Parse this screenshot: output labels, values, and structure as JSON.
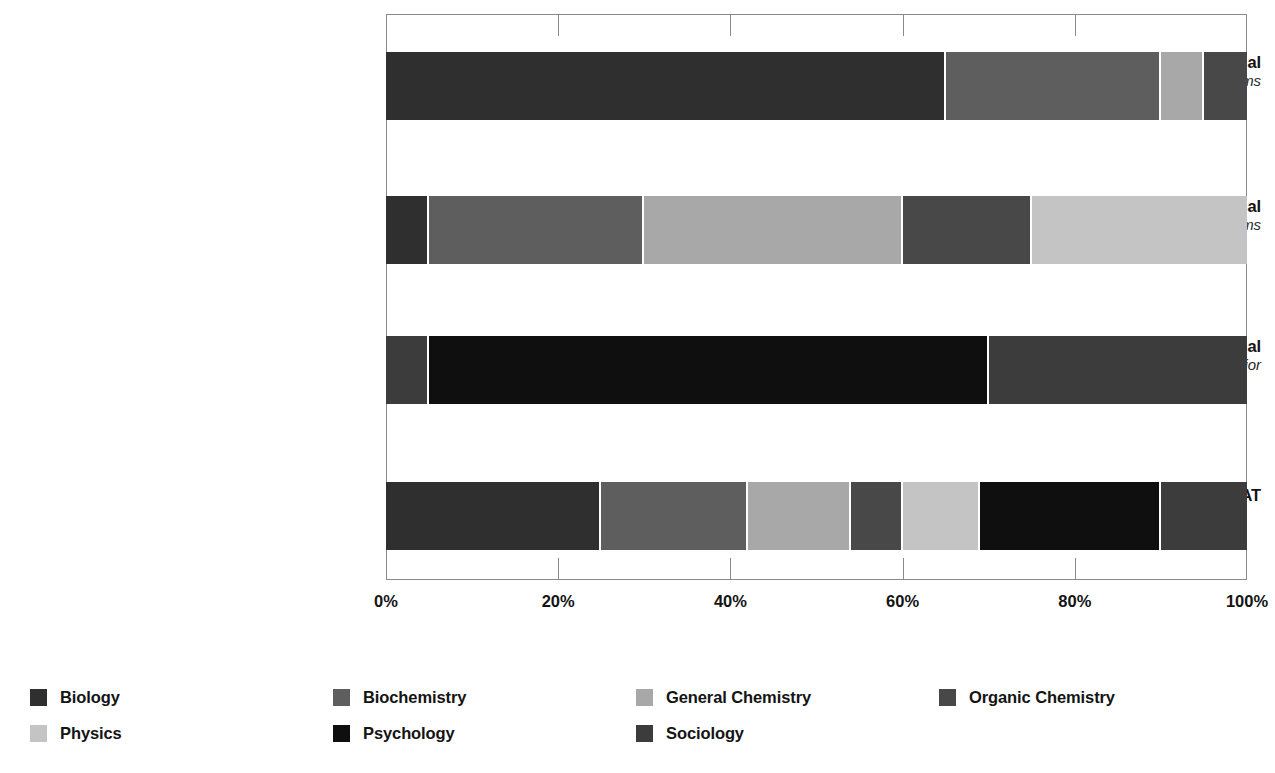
{
  "chart_data": {
    "type": "bar",
    "orientation": "horizontal",
    "stacked": true,
    "normalized_percent": true,
    "title": "",
    "xlabel": "",
    "ylabel": "",
    "xlim": [
      0,
      100
    ],
    "xticks": [
      "0%",
      "20%",
      "40%",
      "60%",
      "80%",
      "100%"
    ],
    "xtick_values": [
      0,
      20,
      40,
      60,
      80,
      100
    ],
    "grid": true,
    "legend_position": "bottom",
    "categories": [
      {
        "main": "Biological and Biochemical",
        "sub": "Foundations of Living Systems"
      },
      {
        "main": "Chemical and Physical",
        "sub": "Foundations of Biological Systems"
      },
      {
        "main": "Psychological, Social, and Biological",
        "sub": "Foundations of Behavior"
      },
      {
        "main": "MCAT",
        "sub": ""
      }
    ],
    "series": [
      {
        "name": "Biology",
        "color": "#2f2f2f",
        "values": [
          65,
          5,
          5,
          25
        ]
      },
      {
        "name": "Biochemistry",
        "color": "#5e5e5e",
        "values": [
          25,
          25,
          0,
          17
        ]
      },
      {
        "name": "General Chemistry",
        "color": "#a8a8a8",
        "values": [
          5,
          30,
          0,
          12
        ]
      },
      {
        "name": "Organic Chemistry",
        "color": "#484848",
        "values": [
          5,
          15,
          0,
          6
        ]
      },
      {
        "name": "Physics",
        "color": "#c4c4c4",
        "values": [
          0,
          25,
          0,
          9
        ]
      },
      {
        "name": "Psychology",
        "color": "#0f0f0f",
        "values": [
          0,
          0,
          65,
          21
        ]
      },
      {
        "name": "Sociology",
        "color": "#3c3c3c",
        "values": [
          0,
          0,
          30,
          10
        ]
      }
    ],
    "bars": [
      {
        "category": "Biological and Biochemical",
        "segments": [
          {
            "name": "Biology",
            "value": 65,
            "color": "#2f2f2f"
          },
          {
            "name": "Biochemistry",
            "value": 25,
            "color": "#5e5e5e"
          },
          {
            "name": "General Chemistry",
            "value": 5,
            "color": "#a8a8a8"
          },
          {
            "name": "Organic Chemistry",
            "value": 5,
            "color": "#484848"
          }
        ]
      },
      {
        "category": "Chemical and Physical",
        "segments": [
          {
            "name": "Biology",
            "value": 5,
            "color": "#2f2f2f"
          },
          {
            "name": "Biochemistry",
            "value": 25,
            "color": "#5e5e5e"
          },
          {
            "name": "General Chemistry",
            "value": 30,
            "color": "#a8a8a8"
          },
          {
            "name": "Organic Chemistry",
            "value": 15,
            "color": "#484848"
          },
          {
            "name": "Physics",
            "value": 25,
            "color": "#c4c4c4"
          }
        ]
      },
      {
        "category": "Psychological, Social, and Biological",
        "segments": [
          {
            "name": "Biology",
            "value": 5,
            "color": "#3c3c3c"
          },
          {
            "name": "Psychology",
            "value": 65,
            "color": "#0f0f0f"
          },
          {
            "name": "Sociology",
            "value": 30,
            "color": "#3c3c3c"
          }
        ]
      },
      {
        "category": "MCAT",
        "segments": [
          {
            "name": "Biology",
            "value": 25,
            "color": "#2f2f2f"
          },
          {
            "name": "Biochemistry",
            "value": 17,
            "color": "#5e5e5e"
          },
          {
            "name": "General Chemistry",
            "value": 12,
            "color": "#a8a8a8"
          },
          {
            "name": "Organic Chemistry",
            "value": 6,
            "color": "#484848"
          },
          {
            "name": "Physics",
            "value": 9,
            "color": "#c4c4c4"
          },
          {
            "name": "Psychology",
            "value": 21,
            "color": "#0f0f0f"
          },
          {
            "name": "Sociology",
            "value": 10,
            "color": "#3c3c3c"
          }
        ]
      }
    ]
  },
  "axis": {
    "ticks": [
      {
        "label": "0%",
        "value": 0
      },
      {
        "label": "20%",
        "value": 20
      },
      {
        "label": "40%",
        "value": 40
      },
      {
        "label": "60%",
        "value": 60
      },
      {
        "label": "80%",
        "value": 80
      },
      {
        "label": "100%",
        "value": 100
      }
    ]
  },
  "legend": {
    "rows": [
      [
        {
          "label": "Biology",
          "color": "#2f2f2f"
        },
        {
          "label": "Biochemistry",
          "color": "#5e5e5e"
        },
        {
          "label": "General Chemistry",
          "color": "#a8a8a8"
        },
        {
          "label": "Organic Chemistry",
          "color": "#484848"
        }
      ],
      [
        {
          "label": "Physics",
          "color": "#c4c4c4"
        },
        {
          "label": "Psychology",
          "color": "#0f0f0f"
        },
        {
          "label": "Sociology",
          "color": "#3c3c3c"
        }
      ]
    ]
  }
}
